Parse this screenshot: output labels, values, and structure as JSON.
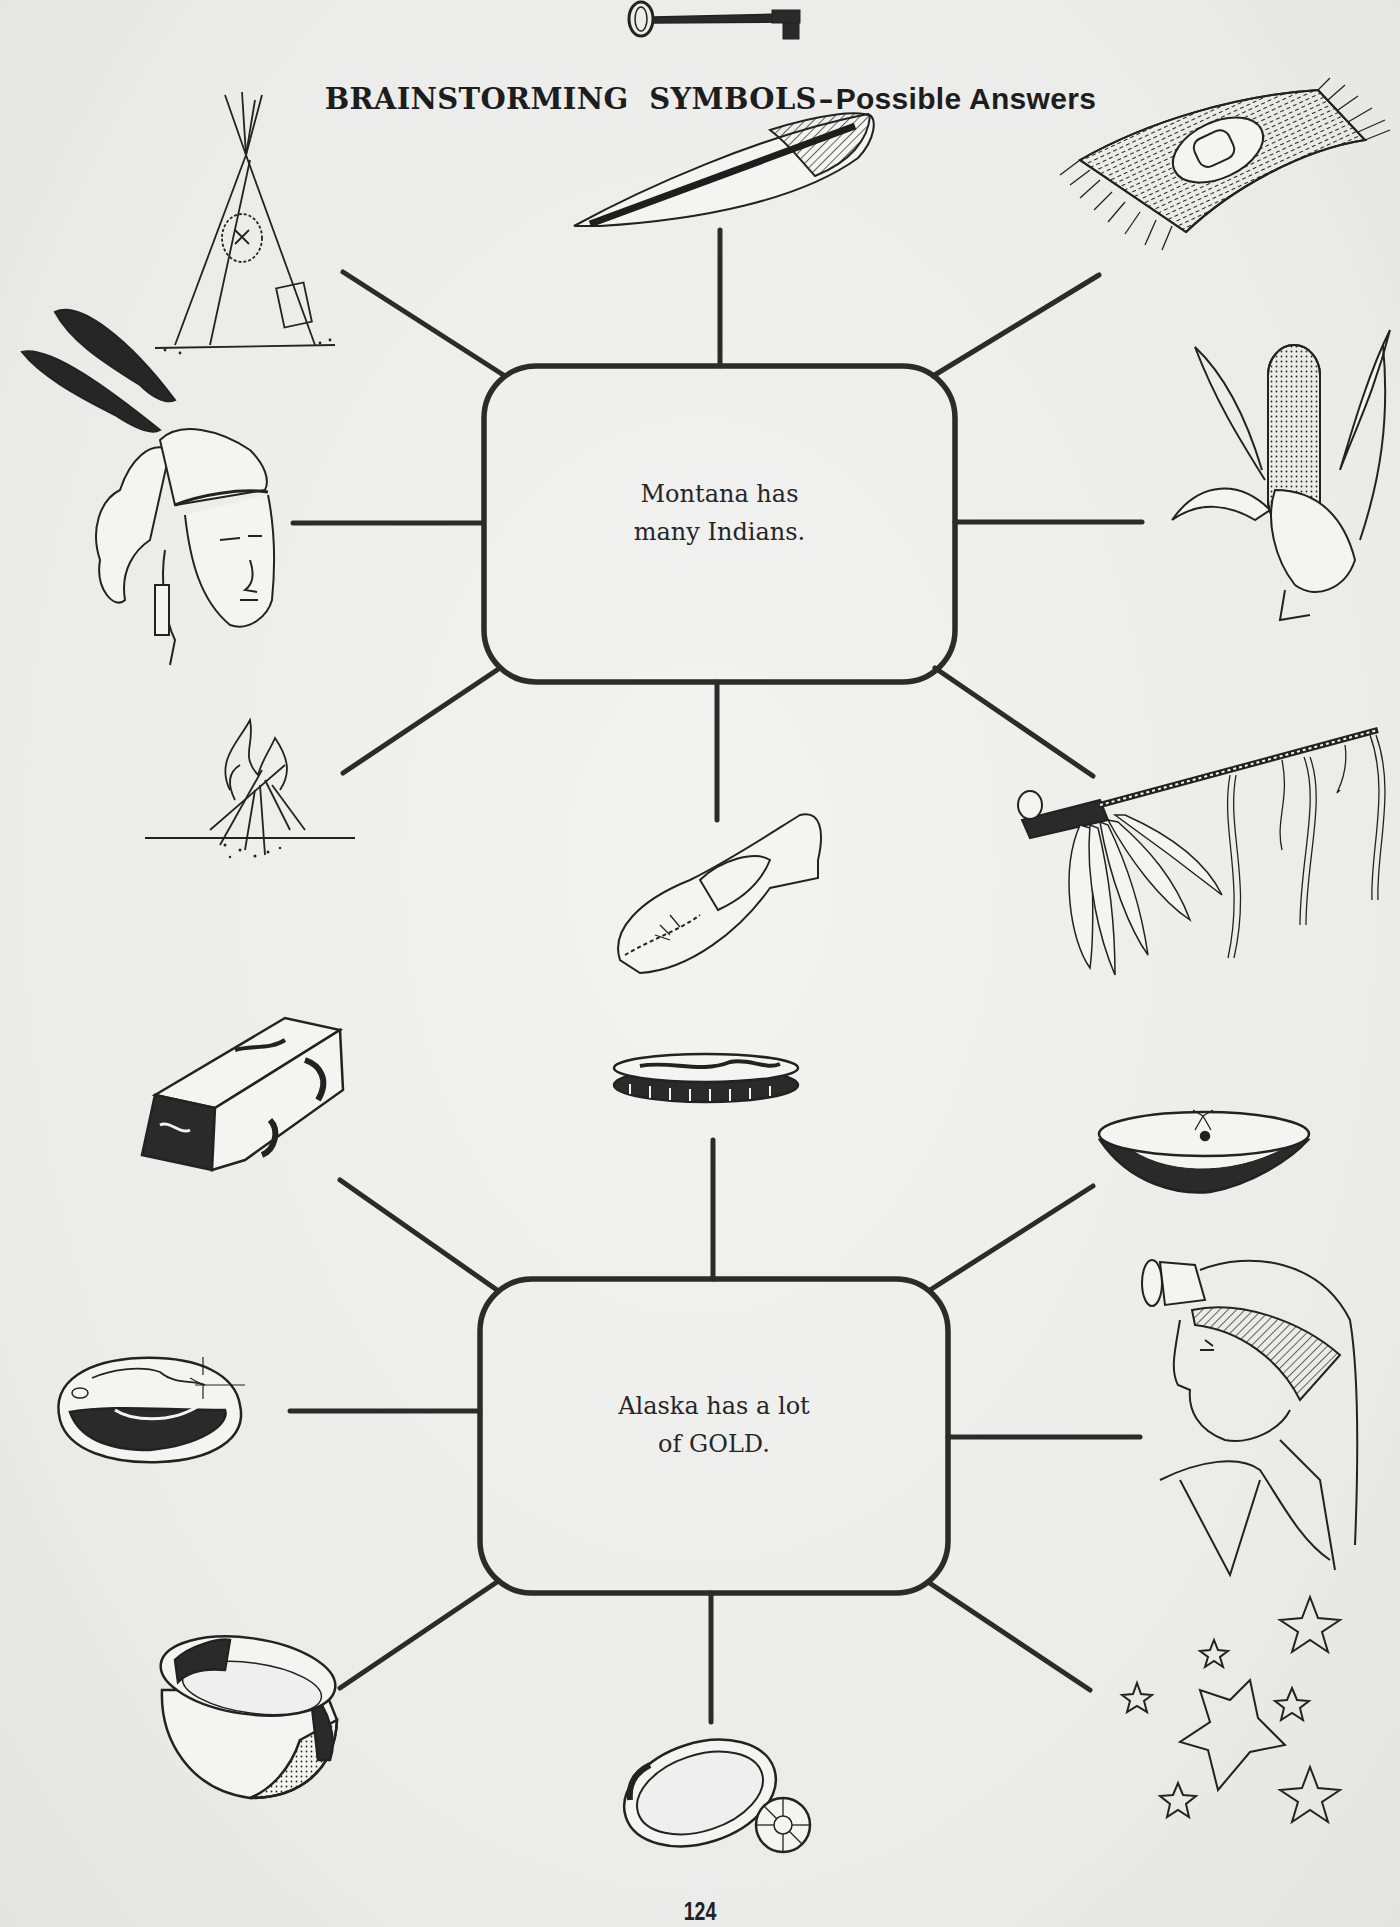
{
  "header": {
    "title_main": "BRAINSTORMING  SYMBOLS",
    "title_separator": "–",
    "title_sub": "Possible Answers",
    "header_icon": "skeleton-key-icon"
  },
  "diagrams": [
    {
      "id": "montana",
      "center_text": [
        "Montana has",
        "many Indians."
      ],
      "symbols": [
        {
          "position": "top",
          "icon": "feather-icon",
          "label": "Feather"
        },
        {
          "position": "top-right",
          "icon": "rug-icon",
          "label": "Woven rug"
        },
        {
          "position": "right",
          "icon": "corn-icon",
          "label": "Ear of corn"
        },
        {
          "position": "bottom-right",
          "icon": "peace-pipe-icon",
          "label": "Peace pipe"
        },
        {
          "position": "bottom",
          "icon": "moccasin-icon",
          "label": "Moccasin"
        },
        {
          "position": "bottom-left",
          "icon": "campfire-icon",
          "label": "Campfire"
        },
        {
          "position": "left",
          "icon": "chief-headdress-icon",
          "label": "Indian chief with headdress"
        },
        {
          "position": "top-left",
          "icon": "teepee-icon",
          "label": "Teepee"
        }
      ]
    },
    {
      "id": "alaska",
      "center_text": [
        "Alaska has a lot",
        "of GOLD."
      ],
      "symbols": [
        {
          "position": "top",
          "icon": "gold-coin-icon",
          "label": "Gold coin"
        },
        {
          "position": "top-right",
          "icon": "gold-pan-icon",
          "label": "Gold pan"
        },
        {
          "position": "right",
          "icon": "miner-icon",
          "label": "Miner with headlamp"
        },
        {
          "position": "bottom-right",
          "icon": "stars-icon",
          "label": "Stars"
        },
        {
          "position": "bottom",
          "icon": "signet-ring-icon",
          "label": "Signet ring"
        },
        {
          "position": "bottom-left",
          "icon": "gold-band-ring-icon",
          "label": "Gold band ring"
        },
        {
          "position": "left",
          "icon": "gold-nugget-icon",
          "label": "Gold nugget"
        },
        {
          "position": "top-left",
          "icon": "gold-bar-icon",
          "label": "Gold bar"
        }
      ]
    }
  ],
  "footer": {
    "page_number": "124"
  },
  "colors": {
    "ink": "#222222",
    "paper": "#efefef"
  }
}
